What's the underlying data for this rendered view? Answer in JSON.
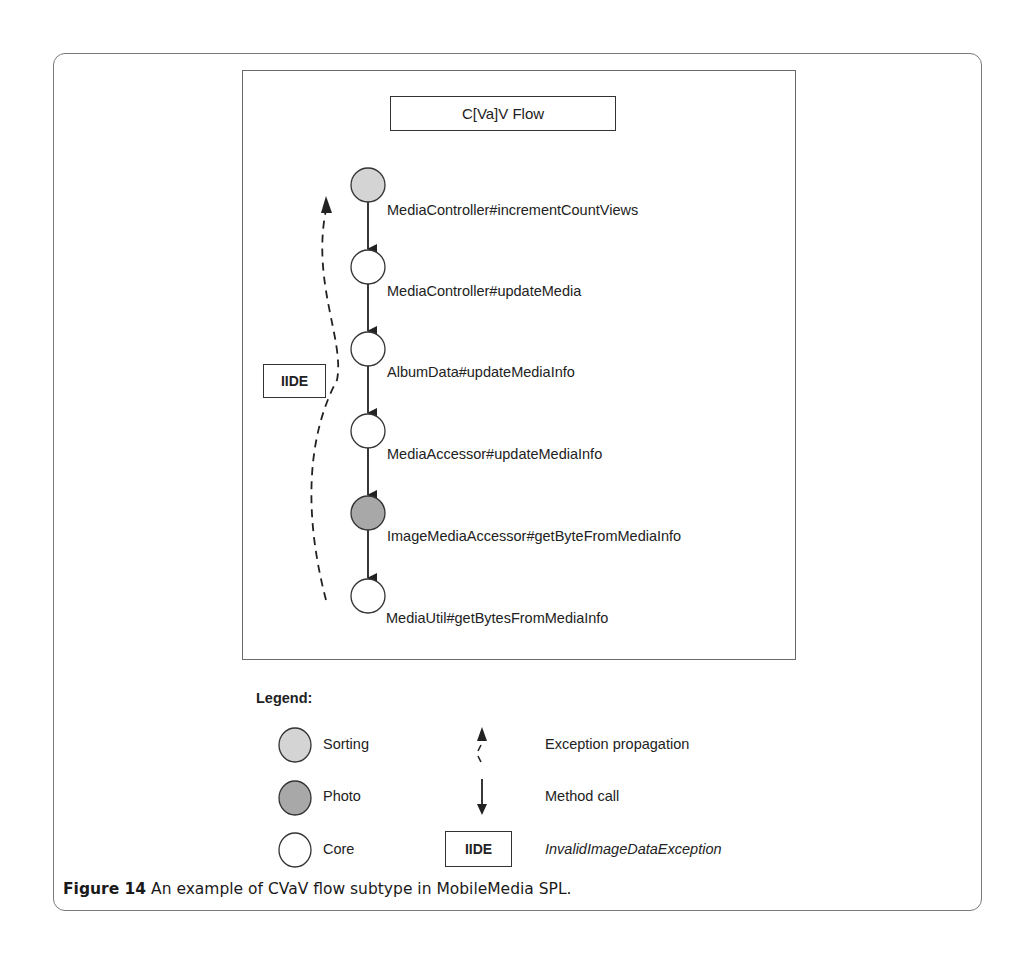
{
  "figure": {
    "title": "C[Va]V Flow",
    "colors": {
      "sorting": "#d4d4d4",
      "photo": "#a8a8a8",
      "core": "#ffffff",
      "stroke": "#222222"
    },
    "nodes": [
      {
        "label": "MediaController#incrementCountViews",
        "feature": "Sorting"
      },
      {
        "label": "MediaController#updateMedia",
        "feature": "Core"
      },
      {
        "label": "AlbumData#updateMediaInfo",
        "feature": "Core"
      },
      {
        "label": "MediaAccessor#updateMediaInfo",
        "feature": "Core"
      },
      {
        "label": "ImageMediaAccessor#getByteFromMediaInfo",
        "feature": "Photo"
      },
      {
        "label": "MediaUtil#getBytesFromMediaInfo",
        "feature": "Core"
      }
    ],
    "exception_label": "IIDE"
  },
  "legend": {
    "title": "Legend:",
    "items": [
      {
        "symbol": "light-gray-circle",
        "label": "Sorting"
      },
      {
        "symbol": "dark-gray-circle",
        "label": "Photo"
      },
      {
        "symbol": "white-circle",
        "label": "Core"
      },
      {
        "symbol": "dashed-up-arrow",
        "label": "Exception propagation"
      },
      {
        "symbol": "solid-down-arrow",
        "label": "Method call"
      },
      {
        "symbol": "IIDE",
        "label": "InvalidImageDataException"
      }
    ]
  },
  "caption": {
    "label": "Figure 14",
    "text": " An example of CVaV flow subtype in MobileMedia SPL."
  }
}
